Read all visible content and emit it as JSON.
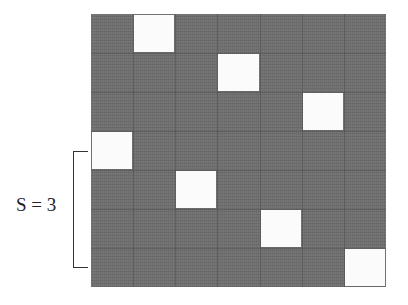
{
  "diagram": {
    "rows": 7,
    "cols": 7,
    "grid_color": "#6f6f6f",
    "highlight_color": "#fbfbfb",
    "highlighted_cells": [
      {
        "row": 0,
        "col": 1
      },
      {
        "row": 1,
        "col": 3
      },
      {
        "row": 2,
        "col": 5
      },
      {
        "row": 3,
        "col": 0
      },
      {
        "row": 4,
        "col": 2
      },
      {
        "row": 5,
        "col": 4
      },
      {
        "row": 6,
        "col": 6
      }
    ],
    "bracket_label": "S = 3",
    "bracket_span_rows": [
      3.5,
      6.5
    ]
  }
}
